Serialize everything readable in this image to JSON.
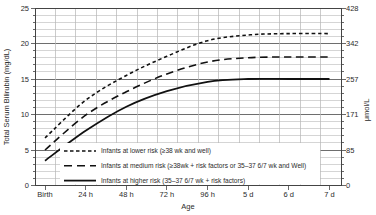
{
  "chart_data": {
    "type": "line",
    "title": "",
    "xlabel": "Age",
    "ylabel_left": "Total Serum Bilirubin (mg/dL)",
    "ylabel_right": "μmol/L",
    "x_categories": [
      "Birth",
      "24 h",
      "48 h",
      "72 h",
      "96 h",
      "5 d",
      "6 d",
      "7 d"
    ],
    "y_ticks_left": [
      0,
      5,
      10,
      15,
      20,
      25
    ],
    "y_ticks_right": [
      0,
      85,
      171,
      257,
      342,
      428
    ],
    "ylim": [
      0,
      25
    ],
    "grid": "major and minor, on",
    "legend_position": "inside bottom-left",
    "series": [
      {
        "name": "Infants at lower risk (≥38 wk and well)",
        "style": "dashed-short",
        "values": [
          6.7,
          12.0,
          15.5,
          18.2,
          20.4,
          21.2,
          21.4,
          21.4
        ]
      },
      {
        "name": "Infants at medium risk (≥38wk + risk factors or 35–37 6/7 wk and Well)",
        "style": "dashed-long",
        "values": [
          5.0,
          9.9,
          13.2,
          15.7,
          17.4,
          18.0,
          18.1,
          18.1
        ]
      },
      {
        "name": "Infants at higher risk (35–37 6/7 wk + risk factors)",
        "style": "solid",
        "values": [
          3.5,
          7.7,
          11.1,
          13.3,
          14.6,
          15.0,
          15.0,
          15.0
        ]
      }
    ]
  },
  "colors": {
    "background": "#ffffff",
    "curve": "#111111",
    "grid_minor": "#c3c3c3",
    "grid_major": "#6e6e6e",
    "grid_vertical": "#b5b5b5",
    "frame": "#444444",
    "text": "#2b2b2b"
  }
}
